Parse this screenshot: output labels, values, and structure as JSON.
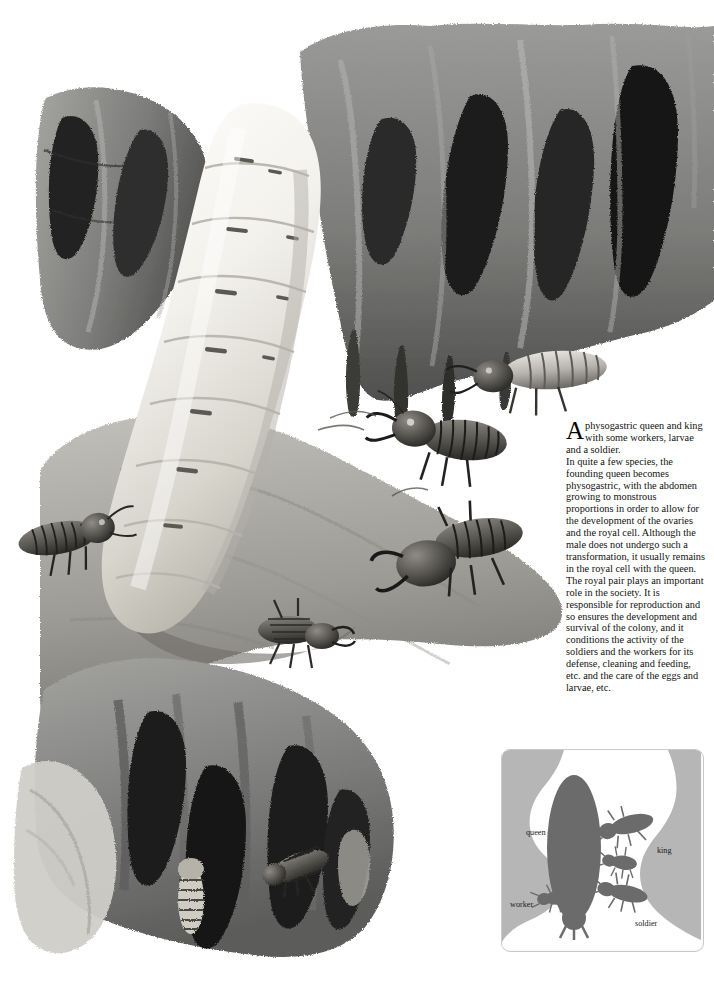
{
  "page": {
    "background_color": "#ffffff",
    "ink_color": "#111111"
  },
  "caption": {
    "dropcap": "A",
    "paragraph_1": "physogastric queen and king with some workers, larvae and a soldier.",
    "paragraph_2": "In quite a few species, the founding queen becomes physogastric, with the abdomen growing to monstrous proportions in order to allow for the development of the ovaries and the royal cell. Although the male does not undergo such a transformation, it usually remains in the royal cell with the queen. The royal pair plays an important role in the society. It is responsible for reproduction and so ensures the development and survival of the colony, and it conditions the activity of the soldiers and the workers for its defense, cleaning and feeding, etc. and the care of the eggs and larvae, etc."
  },
  "illustration": {
    "title": "termite-royal-chamber-illustration",
    "subject": "physogastric queen termite in royal cell with king, workers, larvae and soldier",
    "palette": {
      "queen_body_light": "#f4f2ee",
      "queen_body_shadow": "#c9c6bf",
      "nest_mid": "#8e8e8e",
      "nest_dark": "#4c4c4c",
      "nest_darkest": "#1c1c1c",
      "nest_light": "#b8b8b4",
      "termite_dark": "#3a3a38"
    }
  },
  "inset": {
    "name": "royal-cell-schematic",
    "border_color": "#c9c9c9",
    "nest_fill": "#b4b4b4",
    "cell_fill": "#ffffff",
    "figure_fill": "#6f6f6f",
    "labels": [
      {
        "id": "queen",
        "text": "queen"
      },
      {
        "id": "king",
        "text": "king"
      },
      {
        "id": "worker",
        "text": "worker"
      },
      {
        "id": "soldier",
        "text": "soldier"
      }
    ]
  }
}
